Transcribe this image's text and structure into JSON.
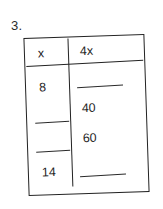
{
  "problem": {
    "number_label": "3."
  },
  "table": {
    "headers": {
      "input": "x",
      "output": "4x"
    },
    "rows": [
      {
        "input": "8",
        "output": ""
      },
      {
        "input": "",
        "output": "40"
      },
      {
        "input": "",
        "output": "60"
      },
      {
        "input": "14",
        "output": ""
      }
    ]
  },
  "colors": {
    "ink": "#222222",
    "background": "#ffffff"
  },
  "chart_data": {
    "type": "table",
    "title": "",
    "columns": [
      "x",
      "4x"
    ],
    "rows": [
      [
        "8",
        ""
      ],
      [
        "",
        "40"
      ],
      [
        "",
        "60"
      ],
      [
        "14",
        ""
      ]
    ]
  }
}
